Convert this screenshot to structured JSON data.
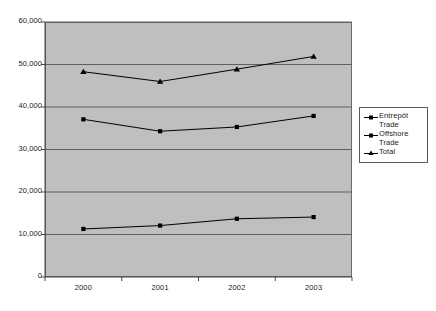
{
  "chart_data": {
    "type": "line",
    "title": "",
    "subtitle": "",
    "xlabel": "",
    "ylabel": "",
    "categories": [
      "2000",
      "2001",
      "2002",
      "2003"
    ],
    "ylim": [
      0,
      60000
    ],
    "ytick_values": [
      0,
      10000,
      20000,
      30000,
      40000,
      50000,
      60000
    ],
    "ytick_labels": [
      "0",
      "10,000",
      "20,000",
      "30,000",
      "40,000",
      "50,000",
      "60,000"
    ],
    "grid": "horizontal",
    "legend_position": "right",
    "plot_background": "#bfbfbf",
    "series": [
      {
        "name": "Entrepôt Trade",
        "marker": "square",
        "color": "#000000",
        "values": [
          37100,
          34300,
          35300,
          37900
        ]
      },
      {
        "name": "Offshore Trade",
        "marker": "square",
        "color": "#000000",
        "values": [
          11300,
          12100,
          13700,
          14100
        ]
      },
      {
        "name": "Total",
        "marker": "triangle",
        "color": "#000000",
        "values": [
          48300,
          46000,
          48900,
          51900
        ]
      }
    ]
  },
  "legend": {
    "items": [
      {
        "label_line1": "Entrepôt",
        "label_line2": "Trade",
        "marker": "square"
      },
      {
        "label_line1": "Offshore",
        "label_line2": "Trade",
        "marker": "square"
      },
      {
        "label_line1": "Total",
        "label_line2": "",
        "marker": "triangle"
      }
    ]
  },
  "axis": {
    "y_labels": [
      "60,000",
      "50,000",
      "40,000",
      "30,000",
      "20,000",
      "10,000",
      "0"
    ],
    "x_labels": [
      "2000",
      "2001",
      "2002",
      "2003"
    ]
  }
}
